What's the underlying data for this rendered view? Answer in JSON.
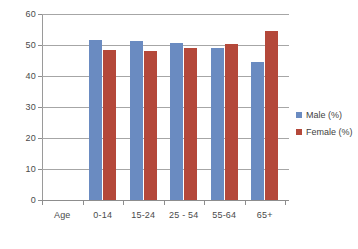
{
  "chart_data": {
    "type": "bar",
    "title": "",
    "xlabel": "",
    "ylabel": "",
    "ylim": [
      0,
      60
    ],
    "yticks": [
      0,
      10,
      20,
      30,
      40,
      50,
      60
    ],
    "grid": true,
    "legend_position": "right",
    "categories": [
      "Age",
      "0-14",
      "15-24",
      "25 - 54",
      "55-64",
      "65+"
    ],
    "series": [
      {
        "name": "Male (%)",
        "color": "#6a8bc1",
        "values": [
          null,
          51.5,
          51.4,
          50.5,
          48.9,
          44.5
        ]
      },
      {
        "name": "Female (%)",
        "color": "#b4483a",
        "values": [
          null,
          48.3,
          48.2,
          49.0,
          50.4,
          54.6
        ]
      }
    ]
  },
  "axis": {
    "y_tick_labels": [
      "0",
      "10",
      "20",
      "30",
      "40",
      "50",
      "60"
    ],
    "x_tick_labels": [
      "Age",
      "0-14",
      "15-24",
      "25 - 54",
      "55-64",
      "65+"
    ]
  },
  "legend": {
    "items": [
      {
        "label": "Male (%)"
      },
      {
        "label": "Female (%)"
      }
    ]
  }
}
